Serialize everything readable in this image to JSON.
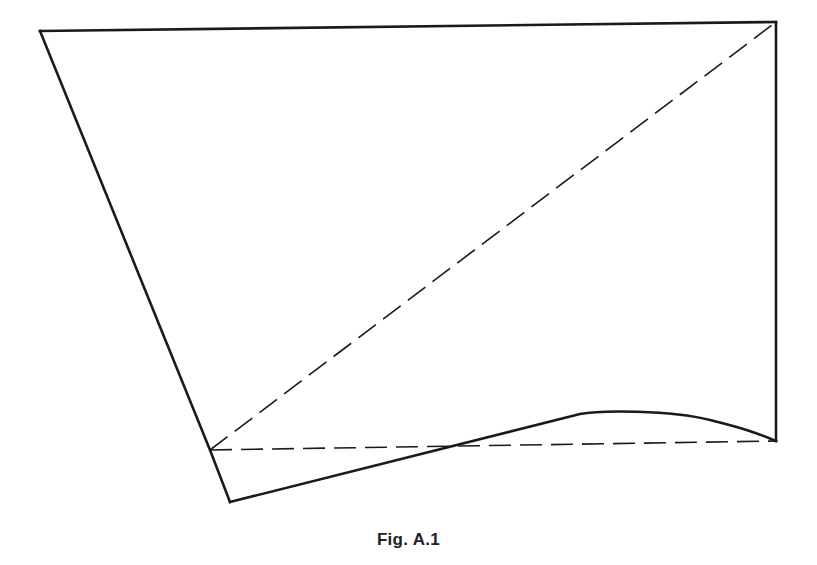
{
  "figure": {
    "caption": "Fig. A.1",
    "line_color": "#1a1a1a",
    "background": "#ffffff",
    "vertices": {
      "top_left": [
        40,
        31
      ],
      "top_right": [
        776,
        22
      ],
      "bottom_right": [
        776,
        441
      ],
      "left_mid": [
        210,
        450
      ],
      "bottom_left": [
        230,
        502
      ],
      "curve_knee": [
        580,
        414
      ]
    },
    "solid_edges": [
      {
        "name": "top-edge",
        "from": "top_left",
        "to": "top_right"
      },
      {
        "name": "right-edge",
        "from": "top_right",
        "to": "bottom_right"
      },
      {
        "name": "left-edge",
        "from": "top_left",
        "to": "bottom_left",
        "via": "left_mid"
      },
      {
        "name": "bottom-curve",
        "from": "bottom_left",
        "to": "bottom_right",
        "via": "curve_knee",
        "shape": "straight-then-arc"
      }
    ],
    "dashed_edges": [
      {
        "name": "diagonal",
        "from": "left_mid",
        "to": "top_right"
      },
      {
        "name": "baseline",
        "from": "left_mid",
        "to": "bottom_right"
      }
    ]
  }
}
